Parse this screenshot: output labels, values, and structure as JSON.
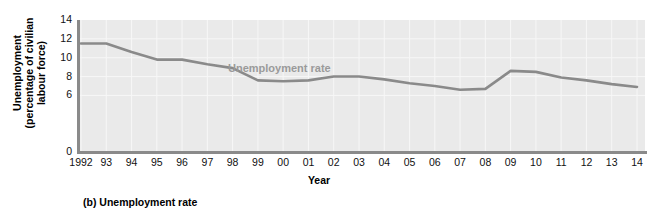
{
  "figure": {
    "caption": "(b) Unemployment rate"
  },
  "chart_data": {
    "type": "line",
    "title": "",
    "annotation": "Unemployment rate",
    "xlabel": "Year",
    "ylabel": "Unemployment\n(percentage of civilian\nlabour force)",
    "grid": true,
    "legend_position": "inline-annotation",
    "line_color": "#8a8a8a",
    "plot_background": "#eaeaea",
    "gridline_color": "#f7f7f7",
    "annotation_color": "#9a9a9a",
    "xlim": [
      1992,
      2014
    ],
    "ylim": [
      0,
      14
    ],
    "ytick_values": [
      14,
      12,
      10,
      8,
      6,
      0
    ],
    "ytick_labels": [
      "14",
      "12",
      "10",
      "8",
      "6",
      "0"
    ],
    "xtick_labels": [
      "1992",
      "93",
      "94",
      "95",
      "96",
      "97",
      "98",
      "99",
      "00",
      "01",
      "02",
      "03",
      "04",
      "05",
      "06",
      "07",
      "08",
      "09",
      "10",
      "11",
      "12",
      "13",
      "14"
    ],
    "x": [
      1992,
      1993,
      1994,
      1995,
      1996,
      1997,
      1998,
      1999,
      2000,
      2001,
      2002,
      2003,
      2004,
      2005,
      2006,
      2007,
      2008,
      2009,
      2010,
      2011,
      2012,
      2013,
      2014
    ],
    "categories": [
      "1992",
      "93",
      "94",
      "95",
      "96",
      "97",
      "98",
      "99",
      "00",
      "01",
      "02",
      "03",
      "04",
      "05",
      "06",
      "07",
      "08",
      "09",
      "10",
      "11",
      "12",
      "13",
      "14"
    ],
    "values": [
      11.5,
      11.5,
      10.6,
      9.8,
      9.8,
      9.3,
      8.9,
      7.6,
      7.5,
      7.6,
      8.0,
      8.0,
      7.7,
      7.3,
      7.0,
      6.6,
      6.7,
      8.6,
      8.5,
      7.9,
      7.6,
      7.2,
      6.9
    ],
    "series": [
      {
        "name": "Unemployment rate",
        "values": [
          11.5,
          11.5,
          10.6,
          9.8,
          9.8,
          9.3,
          8.9,
          7.6,
          7.5,
          7.6,
          8.0,
          8.0,
          7.7,
          7.3,
          7.0,
          6.6,
          6.7,
          8.6,
          8.5,
          7.9,
          7.6,
          7.2,
          6.9
        ]
      }
    ]
  }
}
